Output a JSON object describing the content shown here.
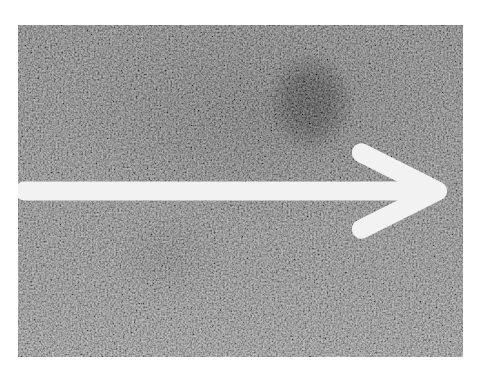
{
  "image": {
    "description": "Grayscale noisy micrograph with dark circular region indicated by a white arrow",
    "background_color": "#ffffff",
    "texture_base_color": "#7a7a7a",
    "colors": {
      "light_region": "#9a9a9a",
      "dark_blob": "#0a0a0a",
      "arrow": "#f2f2f2"
    },
    "annotation": {
      "type": "arrow",
      "direction": "right",
      "points_to": "dark-spot"
    }
  }
}
